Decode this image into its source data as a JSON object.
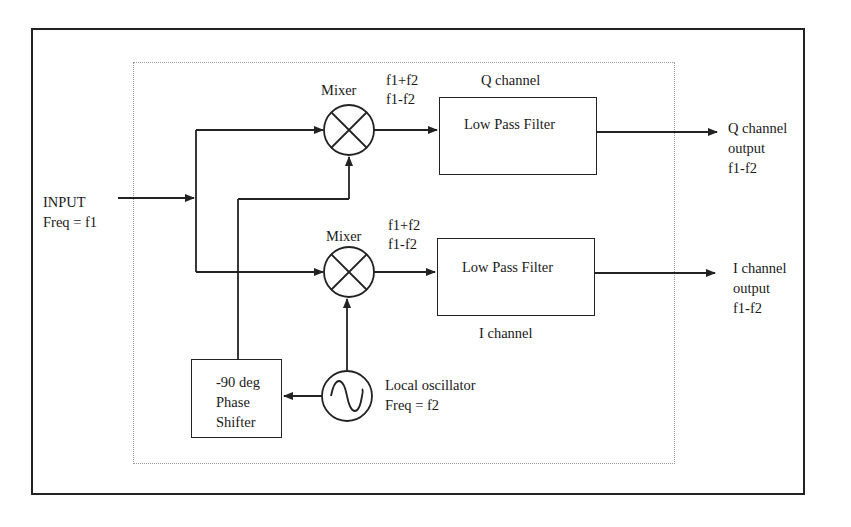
{
  "diagram": {
    "type": "block-diagram",
    "input": {
      "line1": "INPUT",
      "line2": "Freq = f1"
    },
    "mixer_q": {
      "label": "Mixer",
      "out_line1": "f1+f2",
      "out_line2": "f1-f2"
    },
    "mixer_i": {
      "label": "Mixer",
      "out_line1": "f1+f2",
      "out_line2": "f1-f2"
    },
    "lpf_q": {
      "label": "Low Pass Filter",
      "channel_label": "Q channel"
    },
    "lpf_i": {
      "label": "Low Pass Filter",
      "channel_label": "I channel"
    },
    "output_q": {
      "line1": "Q channel",
      "line2": "output",
      "line3": "f1-f2"
    },
    "output_i": {
      "line1": "I channel",
      "line2": "output",
      "line3": "f1-f2"
    },
    "phase_shifter": {
      "line1": "-90 deg",
      "line2": "Phase",
      "line3": "Shifter"
    },
    "oscillator": {
      "line1": "Local oscillator",
      "line2": "Freq = f2"
    },
    "colors": {
      "stroke": "#222222",
      "dotted": "#999999",
      "background": "#ffffff"
    }
  }
}
